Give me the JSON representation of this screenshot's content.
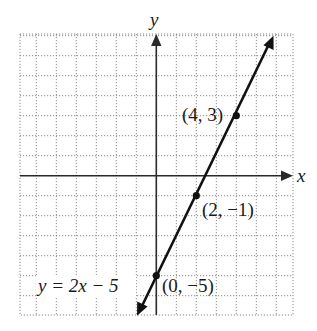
{
  "chart_data": {
    "type": "line",
    "title": "",
    "xlabel": "x",
    "ylabel": "y",
    "xlim": [
      -6.8,
      6.8
    ],
    "ylim": [
      -7,
      7
    ],
    "grid": true,
    "grid_style": "dotted",
    "series": [
      {
        "name": "y = 2x − 5",
        "equation": "y = 2x - 5",
        "slope": 2,
        "intercept": -5,
        "x": [
          -1,
          6
        ],
        "y": [
          -7,
          7
        ],
        "arrows": "both"
      }
    ],
    "points": [
      {
        "x": 4,
        "y": 3,
        "label": "(4, 3)"
      },
      {
        "x": 2,
        "y": -1,
        "label": "(2, −1)"
      },
      {
        "x": 0,
        "y": -5,
        "label": "(0, −5)"
      }
    ],
    "annotations": [
      {
        "text": "y = 2x − 5",
        "position": "lower-left"
      }
    ]
  },
  "labels": {
    "x_axis": "x",
    "y_axis": "y",
    "equation": "y = 2x − 5",
    "pt_4_3": "(4, 3)",
    "pt_2_m1": "(2, −1)",
    "pt_0_m5": "(0, −5)"
  },
  "colors": {
    "line": "#111111",
    "axis": "#2a2a2a",
    "grid": "#8a8a8a",
    "background": "#ffffff"
  }
}
